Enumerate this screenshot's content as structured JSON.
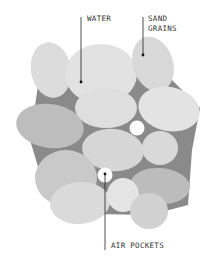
{
  "diagram": {
    "colors": {
      "background": "#ffffff",
      "water": "#8a8a8a",
      "grain_light": "#dedede",
      "grain_mid": "#d2d2d2",
      "grain_dark": "#bdbdbd",
      "air": "#ffffff",
      "leader": "#222222",
      "text": "#333333"
    },
    "labels": {
      "water": "WATER",
      "sand_line1": "SAND",
      "sand_line2": "GRAINS",
      "air_pockets": "AIR POCKETS"
    }
  }
}
